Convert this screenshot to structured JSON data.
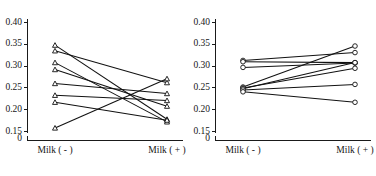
{
  "figure": {
    "width": 376,
    "height": 176,
    "background": "#ffffff",
    "ink_color": "#111111"
  },
  "chart_data": [
    {
      "type": "line",
      "panel_id": "left-panel",
      "title": "",
      "xlabel": "",
      "ylabel": "",
      "marker": "triangle",
      "categories": [
        "Milk ( - )",
        "Milk ( + )"
      ],
      "x_tick_labels": [
        "Milk ( - )",
        "Milk ( + )"
      ],
      "y_tick_labels": [
        "0.15",
        "0.20",
        "0.25",
        "0.30",
        "0.35",
        "0.40"
      ],
      "y_ticks": [
        0.15,
        0.2,
        0.25,
        0.3,
        0.35,
        0.4
      ],
      "ylim": [
        0.15,
        0.4
      ],
      "axis_break_label": "0",
      "grid": false,
      "legend": "none",
      "series": [
        {
          "name": "subject-1",
          "values": [
            0.348,
            0.178
          ]
        },
        {
          "name": "subject-2",
          "values": [
            0.335,
            0.262
          ]
        },
        {
          "name": "subject-3",
          "values": [
            0.308,
            0.172
          ]
        },
        {
          "name": "subject-4",
          "values": [
            0.292,
            0.208
          ]
        },
        {
          "name": "subject-5",
          "values": [
            0.26,
            0.237
          ]
        },
        {
          "name": "subject-6",
          "values": [
            0.233,
            0.221
          ]
        },
        {
          "name": "subject-7",
          "values": [
            0.217,
            0.176
          ]
        },
        {
          "name": "subject-8",
          "values": [
            0.158,
            0.271
          ]
        }
      ]
    },
    {
      "type": "line",
      "panel_id": "right-panel",
      "title": "",
      "xlabel": "",
      "ylabel": "",
      "marker": "circle",
      "categories": [
        "Milk ( - )",
        "Milk ( + )"
      ],
      "x_tick_labels": [
        "Milk ( - )",
        "Milk ( + )"
      ],
      "y_tick_labels": [
        "0.15",
        "0.20",
        "0.25",
        "0.30",
        "0.35",
        "0.40"
      ],
      "y_ticks": [
        0.15,
        0.2,
        0.25,
        0.3,
        0.35,
        0.4
      ],
      "ylim": [
        0.15,
        0.4
      ],
      "axis_break_label": "0",
      "grid": false,
      "legend": "none",
      "series": [
        {
          "name": "subject-1",
          "values": [
            0.313,
            0.331
          ]
        },
        {
          "name": "subject-2",
          "values": [
            0.31,
            0.308
          ]
        },
        {
          "name": "subject-3",
          "values": [
            0.297,
            0.307
          ]
        },
        {
          "name": "subject-4",
          "values": [
            0.252,
            0.346
          ]
        },
        {
          "name": "subject-5",
          "values": [
            0.25,
            0.295
          ]
        },
        {
          "name": "subject-6",
          "values": [
            0.248,
            0.308
          ]
        },
        {
          "name": "subject-7",
          "values": [
            0.245,
            0.258
          ]
        },
        {
          "name": "subject-8",
          "values": [
            0.241,
            0.217
          ]
        }
      ]
    }
  ]
}
